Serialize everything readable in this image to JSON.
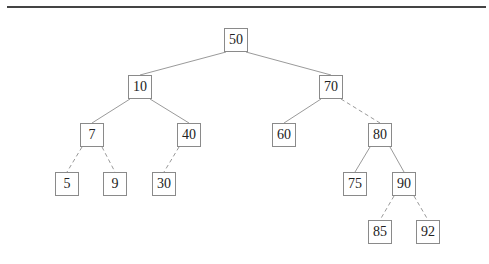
{
  "diagram": {
    "type": "binary-search-tree",
    "node_size": 24,
    "colors": {
      "rule": "#444444",
      "edge": "#9a9a9a",
      "node_border": "#8a8a8a",
      "text": "#222222"
    },
    "nodes": [
      {
        "id": "n50",
        "label": "50",
        "cx": 236,
        "cy": 40
      },
      {
        "id": "n10",
        "label": "10",
        "cx": 140,
        "cy": 87
      },
      {
        "id": "n70",
        "label": "70",
        "cx": 331,
        "cy": 87
      },
      {
        "id": "n7",
        "label": "7",
        "cx": 92,
        "cy": 135
      },
      {
        "id": "n40",
        "label": "40",
        "cx": 189,
        "cy": 135
      },
      {
        "id": "n60",
        "label": "60",
        "cx": 284,
        "cy": 135
      },
      {
        "id": "n80",
        "label": "80",
        "cx": 380,
        "cy": 135
      },
      {
        "id": "n5",
        "label": "5",
        "cx": 67,
        "cy": 184
      },
      {
        "id": "n9",
        "label": "9",
        "cx": 115,
        "cy": 184
      },
      {
        "id": "n30",
        "label": "30",
        "cx": 164,
        "cy": 184
      },
      {
        "id": "n75",
        "label": "75",
        "cx": 355,
        "cy": 184
      },
      {
        "id": "n90",
        "label": "90",
        "cx": 404,
        "cy": 184
      },
      {
        "id": "n85",
        "label": "85",
        "cx": 380,
        "cy": 232
      },
      {
        "id": "n92",
        "label": "92",
        "cx": 428,
        "cy": 232
      }
    ],
    "edges": [
      {
        "from": "n50",
        "to": "n10",
        "style": "solid"
      },
      {
        "from": "n50",
        "to": "n70",
        "style": "solid"
      },
      {
        "from": "n10",
        "to": "n7",
        "style": "solid"
      },
      {
        "from": "n10",
        "to": "n40",
        "style": "solid"
      },
      {
        "from": "n70",
        "to": "n60",
        "style": "solid"
      },
      {
        "from": "n70",
        "to": "n80",
        "style": "dashed"
      },
      {
        "from": "n7",
        "to": "n5",
        "style": "dashed"
      },
      {
        "from": "n7",
        "to": "n9",
        "style": "dashed"
      },
      {
        "from": "n40",
        "to": "n30",
        "style": "dashed"
      },
      {
        "from": "n80",
        "to": "n75",
        "style": "solid"
      },
      {
        "from": "n80",
        "to": "n90",
        "style": "solid"
      },
      {
        "from": "n90",
        "to": "n85",
        "style": "dashed"
      },
      {
        "from": "n90",
        "to": "n92",
        "style": "dashed"
      }
    ]
  }
}
